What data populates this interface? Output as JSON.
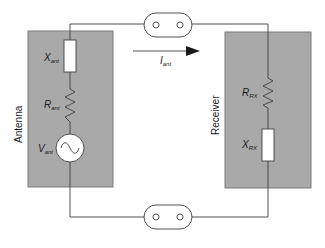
{
  "diagram": {
    "blocks": {
      "antenna": {
        "label": "Antenna"
      },
      "receiver": {
        "label": "Receiver"
      }
    },
    "components": {
      "x_ant": {
        "main": "X",
        "sub": "ant"
      },
      "r_ant": {
        "main": "R",
        "sub": "ant"
      },
      "v_ant": {
        "main": "V",
        "sub": "ant"
      },
      "r_rx": {
        "main": "R",
        "sub": "RX"
      },
      "x_rx": {
        "main": "X",
        "sub": "RX"
      }
    },
    "current": {
      "main": "I",
      "sub": "ant"
    },
    "connectors": [
      "top-connector",
      "bottom-connector"
    ],
    "colors": {
      "block_fill": "#a9a9a9",
      "block_stroke": "#7a7a7a",
      "wire": "#404040",
      "component_fill": "#ffffff"
    }
  }
}
